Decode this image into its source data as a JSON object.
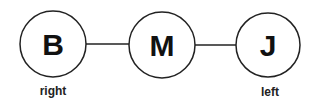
{
  "diagram": {
    "nodes": [
      {
        "id": "B",
        "letter": "B",
        "label": "right",
        "cx": 53,
        "cy": 44,
        "r": 33
      },
      {
        "id": "M",
        "letter": "M",
        "label": "",
        "cx": 162,
        "cy": 45,
        "r": 33
      },
      {
        "id": "J",
        "letter": "J",
        "label": "left",
        "cx": 268,
        "cy": 45,
        "r": 32
      }
    ],
    "edges": [
      {
        "from": "B",
        "to": "M"
      },
      {
        "from": "M",
        "to": "J"
      }
    ],
    "colors": {
      "stroke": "#222222",
      "text": "#111111",
      "background": "#ffffff"
    }
  }
}
